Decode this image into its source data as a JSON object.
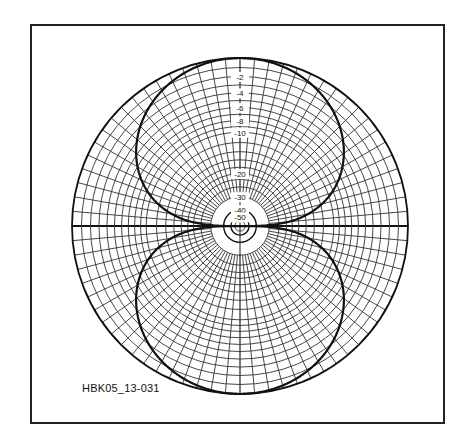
{
  "figure": {
    "id_label": "HBK05_13-031",
    "frame": {
      "x": 30,
      "y": 24,
      "width": 415,
      "height": 400
    }
  },
  "chart_data": {
    "type": "polar",
    "title": "",
    "scale": "ARRL log (each 2 dB = 0.89 radius)",
    "center": [
      240,
      226
    ],
    "radius": 168,
    "ring_labels": [
      "-2",
      "-4",
      "-6",
      "-8",
      "-10",
      "-20",
      "-30",
      "-40",
      "-50"
    ],
    "ring_label_values_db": [
      -2,
      -4,
      -6,
      -8,
      -10,
      -20,
      -30,
      -40,
      -50
    ],
    "grid_rings_db": [
      0,
      -1,
      -2,
      -3,
      -4,
      -5,
      -6,
      -7,
      -8,
      -9,
      -10,
      -12,
      -14,
      -16,
      -18,
      -20,
      -22,
      -25,
      -30,
      -40,
      -50,
      -60
    ],
    "radial_step_deg": 5,
    "series": [
      {
        "name": "pattern",
        "formula": "cos(angle from vertical)",
        "lobes": [
          "up",
          "down"
        ],
        "max_db": 0,
        "null_directions_deg": [
          0,
          180
        ]
      }
    ],
    "grid": true,
    "legend": null
  }
}
